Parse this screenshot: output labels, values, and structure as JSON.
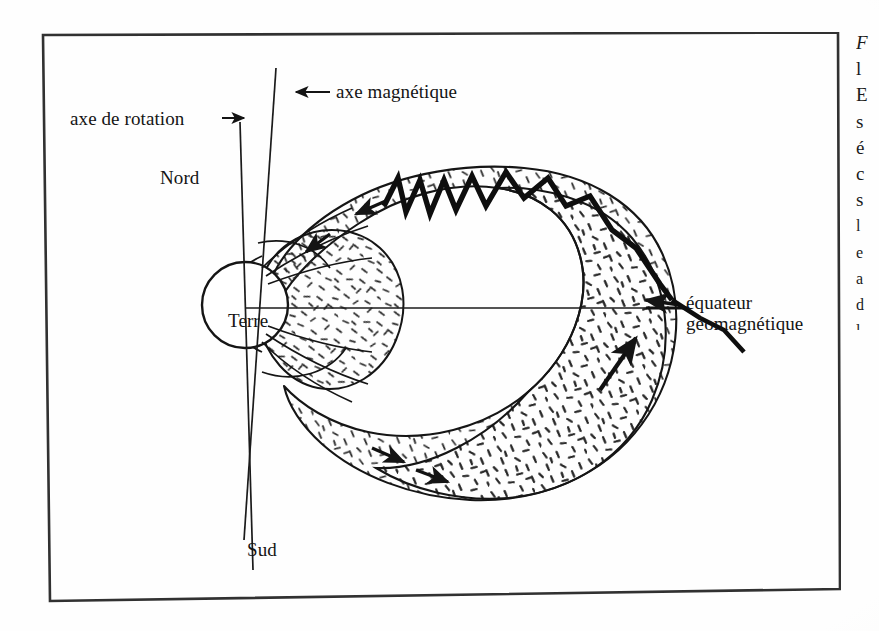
{
  "figure": {
    "frame": {
      "border_color": "#2b2b2b",
      "background": "#ffffff"
    },
    "labels": {
      "axe_de_rotation": "axe de rotation",
      "axe_magnetique": "axe magnétique",
      "nord": "Nord",
      "sud": "Sud",
      "terre": "Terre",
      "equateur_line1": "équateur",
      "equateur_line2": "géomagnétique"
    },
    "arrow_markers": {
      "axe_de_rotation_arrow": "right-arrow-icon",
      "axe_magnetique_arrow": "left-arrow-icon"
    },
    "colors": {
      "ink": "#111111",
      "stipple": "#2a2a2a",
      "paper": "#fefefe"
    }
  },
  "text_column": {
    "note": "right-hand body-text column cropped by the page edge; only leading glyphs visible",
    "lines": [
      "F",
      "l",
      "E",
      "s",
      "é",
      "c",
      "s",
      "l",
      "e",
      "a",
      "d",
      "l"
    ]
  }
}
